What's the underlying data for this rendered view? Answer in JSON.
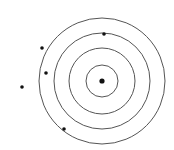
{
  "diagram": {
    "type": "concentric-circles-target",
    "background": "#ffffff",
    "stroke_color": "#555555",
    "dot_color": "#111111",
    "center": {
      "x": 102,
      "y": 81
    },
    "rings": [
      {
        "r": 16
      },
      {
        "r": 33
      },
      {
        "r": 48
      },
      {
        "r": 63
      }
    ],
    "center_dot": {
      "x": 102,
      "y": 81,
      "r": 2.6
    },
    "points": [
      {
        "x": 104,
        "y": 34,
        "r": 1.8
      },
      {
        "x": 42,
        "y": 48,
        "r": 1.8
      },
      {
        "x": 46,
        "y": 73,
        "r": 1.8
      },
      {
        "x": 22,
        "y": 87,
        "r": 1.8
      },
      {
        "x": 64,
        "y": 129,
        "r": 1.8
      }
    ]
  }
}
